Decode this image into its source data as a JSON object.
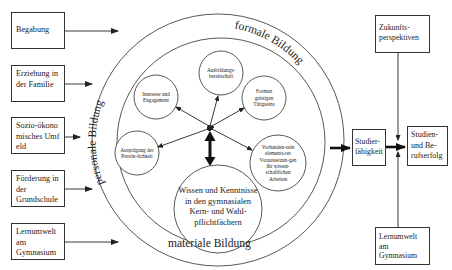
{
  "diagram": {
    "inputs_left": [
      {
        "label": "Begabung"
      },
      {
        "label": "Erziehung in der Familie"
      },
      {
        "label": "Sozio-ökonomisches Umfeld"
      },
      {
        "label": "Förderung in der Grundschule"
      },
      {
        "label": "Lernumwelt am Gymnasium"
      }
    ],
    "rings": {
      "outer_left_label": "personale Bildung",
      "outer_right_label": "formale Bildung",
      "bottom_label": "materiale Bildung"
    },
    "inner_circles": {
      "ausbildung": "Ausbildungs-bereitschaft",
      "interesse": "Interesse und Engagement",
      "formen": "Formen geistigen Tätigseins",
      "auspraegung": "Ausprägung der Persön-lichkeit",
      "vorhandensein": "Vorhanden-sein elementa-rer Voraussetzun-gen für wissen-schaftlichen Arbeiten",
      "wissen": "Wissen und Kenntnisse in den gymnasialen Kern- und Wahl-pflichtfächern"
    },
    "outputs": {
      "studierfaehigkeit": "Studier-fähigkeit",
      "erfolg": "Studien- und Be-rufserfolg",
      "zukunft": "Zukunfts-perspektiven",
      "lernumwelt": "Lernumwelt am Gymnasium"
    }
  },
  "colors": {
    "line": "#333333",
    "background": "#ffffff"
  }
}
